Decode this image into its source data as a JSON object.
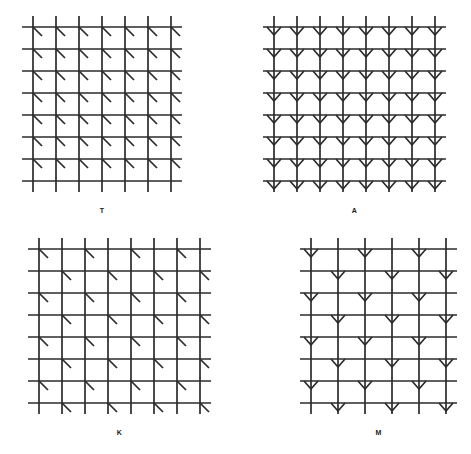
{
  "figure": {
    "title": "",
    "background_color": "#ffffff",
    "stroke_color": "#2b2b2b",
    "width": 471,
    "height": 454,
    "panel_count": 4
  },
  "panels": [
    {
      "id": "panel-t",
      "label": "T",
      "position": {
        "x": 22,
        "y": 16
      },
      "grid": {
        "cols": 7,
        "rows": 8,
        "cell_w": 23,
        "cell_h": 22,
        "overhang": 11,
        "line_width": 1.7
      },
      "element": {
        "type": "diagonal",
        "description": "short diagonal stroke from intersection toward lower-right",
        "length": 9,
        "line_width": 1.7
      },
      "pattern": {
        "type": "uniform",
        "skip_last_row": true,
        "note": "diagonal at every intersection except bottom row"
      },
      "label_offset_y": 14
    },
    {
      "id": "panel-a",
      "label": "A",
      "position": {
        "x": 263,
        "y": 16
      },
      "grid": {
        "cols": 8,
        "rows": 8,
        "cell_w": 23,
        "cell_h": 22,
        "overhang": 11,
        "line_width": 1.7
      },
      "element": {
        "type": "chevron-down",
        "description": "V-shaped arrowhead opening upward at each intersection",
        "half_width": 7,
        "depth": 8,
        "line_width": 1.7
      },
      "pattern": {
        "type": "uniform",
        "skip_last_row": false,
        "note": "arrowhead at every intersection of every row"
      },
      "label_offset_y": 14
    },
    {
      "id": "panel-k",
      "label": "K",
      "position": {
        "x": 28,
        "y": 238
      },
      "grid": {
        "cols": 8,
        "rows": 8,
        "cell_w": 23,
        "cell_h": 22,
        "overhang": 11,
        "line_width": 1.7
      },
      "element": {
        "type": "diagonal",
        "description": "short diagonal stroke from intersection toward lower-right",
        "length": 9,
        "line_width": 1.7
      },
      "pattern": {
        "type": "checkerboard",
        "phase": 0,
        "skip_last_row": false,
        "note": "diagonal only at alternating intersections, phase shifts each row"
      },
      "label_offset_y": 14
    },
    {
      "id": "panel-m",
      "label": "M",
      "position": {
        "x": 300,
        "y": 238
      },
      "grid": {
        "cols": 6,
        "rows": 8,
        "cell_w": 27,
        "cell_h": 22,
        "overhang": 11,
        "line_width": 1.7
      },
      "element": {
        "type": "chevron-down",
        "description": "V-shaped arrowhead opening upward at each intersection",
        "half_width": 7,
        "depth": 8,
        "line_width": 1.7
      },
      "pattern": {
        "type": "checkerboard",
        "phase": 0,
        "skip_last_row": false,
        "note": "arrowhead only at alternating intersections, phase shifts each row"
      },
      "label_offset_y": 14
    }
  ]
}
